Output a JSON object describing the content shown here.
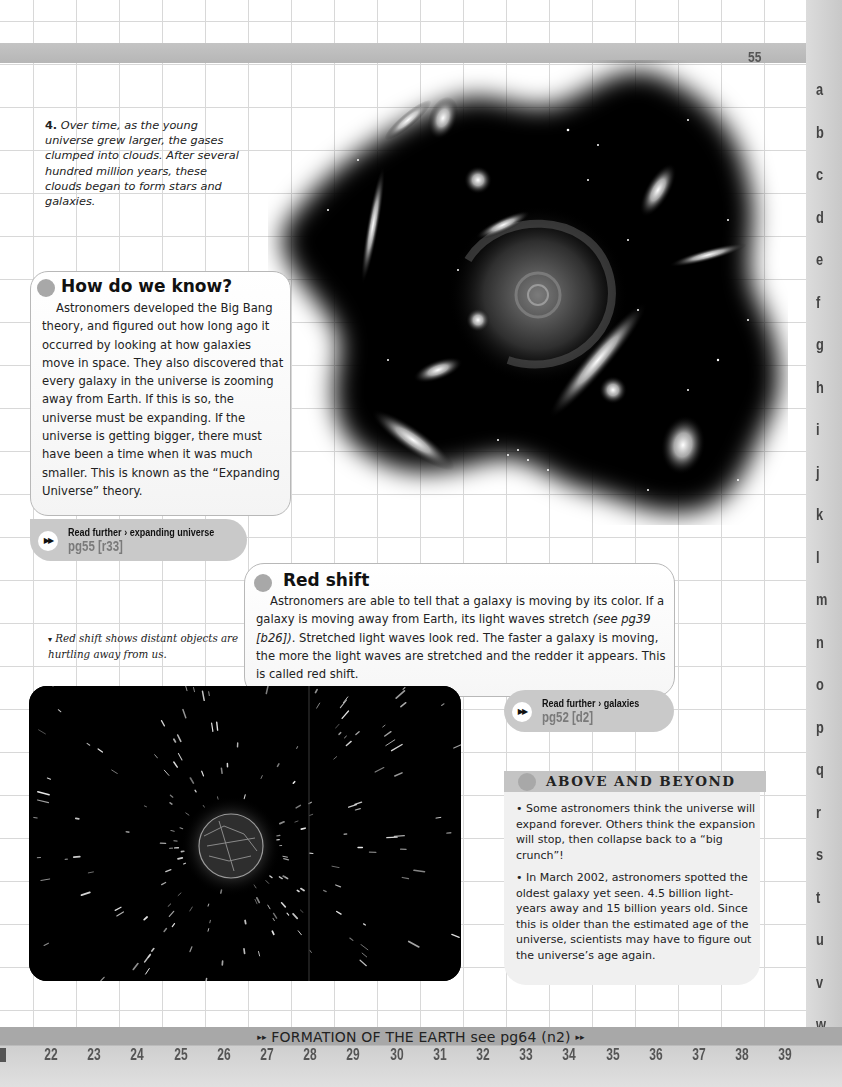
{
  "page": {
    "number": "55",
    "row_letters": [
      "a",
      "b",
      "c",
      "d",
      "e",
      "f",
      "g",
      "h",
      "i",
      "j",
      "k",
      "l",
      "m",
      "n",
      "o",
      "p",
      "q",
      "r",
      "s",
      "t",
      "u",
      "v",
      "w"
    ],
    "column_numbers": [
      "22",
      "23",
      "24",
      "25",
      "26",
      "27",
      "28",
      "29",
      "30",
      "31",
      "32",
      "33",
      "34",
      "35",
      "36",
      "37",
      "38",
      "39"
    ]
  },
  "caption_4": {
    "number": "4.",
    "text": "Over time, as the young universe grew larger, the gases clumped into clouds. After several hundred million years, these clouds began to form stars and galaxies."
  },
  "how_do_we_know": {
    "title": "How do we know?",
    "body": "Astronomers developed the Big Bang theory, and figured out how long ago it occurred by looking at how galaxies move in space. They also discovered that every galaxy in the universe is zooming away from Earth. If this is so, the universe must be expanding. If the universe is getting bigger, there must have been a time when it was much smaller. This is known as the “Expanding Universe” theory.",
    "read_further": {
      "icon": "double-arrow-icon",
      "label": "Read further › expanding universe",
      "ref": "pg55 [r33]"
    }
  },
  "red_shift": {
    "title": "Red shift",
    "body_before": "Astronomers are able to tell that a galaxy is moving by its color. If a galaxy is moving away from Earth, its light waves stretch ",
    "body_italic": "(see pg39 [b26])",
    "body_after": ". Stretched light waves look red. The faster a galaxy is moving, the more the light waves are stretched and the redder it appears. This is called red shift.",
    "read_further": {
      "icon": "double-arrow-icon",
      "label": "Read further › galaxies",
      "ref": "pg52 [d2]"
    }
  },
  "photo_caption": {
    "pointer": "▾",
    "text": "Red shift shows distant objects are hurtling away from us."
  },
  "above_and_beyond": {
    "title": "ABOVE AND BEYOND",
    "items": [
      "• Some astronomers think the universe will expand forever. Others think the expansion will stop, then collapse back to a “big crunch”!",
      "• In March 2002, astronomers spotted the oldest galaxy yet seen. 4.5 billion light-years away and 15 billion years old. Since this is older than the estimated age of the universe, scientists may have to figure out the universe’s age again."
    ]
  },
  "footer": {
    "arrows": "▸▸",
    "link_text": "FORMATION OF THE EARTH see pg64 (n2)"
  },
  "colors": {
    "bar_gray": "#b8b8b8",
    "bullet_gray": "#a8a8a8",
    "read_further_bg": "#c9c9c9",
    "ref_text": "#7a7a7a"
  }
}
